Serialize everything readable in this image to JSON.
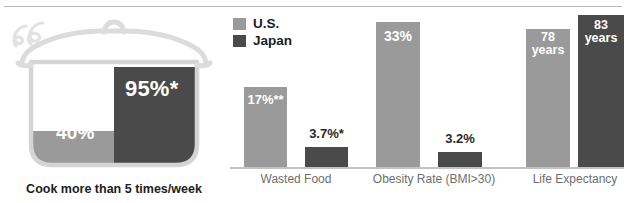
{
  "colors": {
    "us": "#9a9a9a",
    "japan": "#4a4a4a",
    "pot_outline": "#d5d5d5",
    "steam": "#e4e4e4",
    "baseline": "#c2c2c2",
    "top_rule": "#b9b9b9",
    "category_text": "#6e6e6e",
    "caption_text": "#1d1d1d"
  },
  "legend": {
    "items": [
      {
        "label": "U.S.",
        "color": "#9a9a9a",
        "key": "us"
      },
      {
        "label": "Japan",
        "color": "#4a4a4a",
        "key": "japan"
      }
    ]
  },
  "pot": {
    "caption": "Cook more than 5 times/week",
    "us_value_label": "40%",
    "japan_value_label": "95%*",
    "icon": "cooking-pot-icon"
  },
  "groups": [
    {
      "category": "Wasted Food",
      "us_label": "17%**",
      "japan_label": "3.7%*",
      "us_inside": true,
      "japan_inside": false
    },
    {
      "category": "Obesity Rate (BMI>30)",
      "us_label": "33%",
      "japan_label": "3.2%",
      "us_inside": true,
      "japan_inside": false
    },
    {
      "category": "Life Expectancy",
      "us_label": "78\nyears",
      "japan_label": "83\nyears",
      "us_inside": true,
      "japan_inside": true
    }
  ],
  "chart_data": {
    "type": "bar",
    "title": "",
    "subtitle": "",
    "xlabel": "",
    "ylabel": "",
    "grid": false,
    "legend_position": "top-left-of-bar-panel",
    "orientation": "vertical",
    "note": "Grouped bar chart comparing U.S. and Japan. Each group is plotted on its own independent scale (no shared numeric axis, no tick labels shown). A pictorial pot at left encodes the 'Cook more than 5 times/week' comparison.",
    "categories": [
      "Cook more than 5 times/week",
      "Wasted Food",
      "Obesity Rate (BMI>30)",
      "Life Expectancy"
    ],
    "series": [
      {
        "name": "U.S.",
        "color": "#9a9a9a",
        "values": [
          40,
          17,
          33,
          78
        ],
        "value_labels": [
          "40%",
          "17%**",
          "33%",
          "78 years"
        ],
        "units": [
          "percent",
          "percent",
          "percent",
          "years"
        ]
      },
      {
        "name": "Japan",
        "color": "#4a4a4a",
        "values": [
          95,
          3.7,
          3.2,
          83
        ],
        "value_labels": [
          "95%*",
          "3.7%*",
          "3.2%",
          "83 years"
        ],
        "units": [
          "percent",
          "percent",
          "percent",
          "years"
        ]
      }
    ],
    "annotations": [
      {
        "text": "*",
        "attached_to": [
          "Cook more than 5 times/week / Japan",
          "Wasted Food / Japan"
        ]
      },
      {
        "text": "**",
        "attached_to": [
          "Wasted Food / U.S."
        ]
      }
    ]
  }
}
